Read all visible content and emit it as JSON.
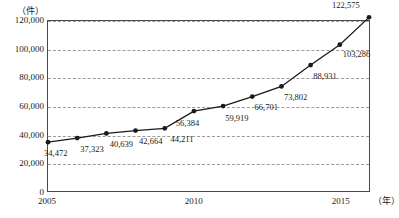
{
  "chart_data": {
    "type": "line",
    "title": "",
    "xlabel": "(年)",
    "ylabel": "(件)",
    "x": [
      2005,
      2006,
      2007,
      2008,
      2009,
      2010,
      2011,
      2012,
      2013,
      2014,
      2015,
      2016
    ],
    "values": [
      34472,
      37323,
      40639,
      42664,
      44211,
      56384,
      59919,
      66701,
      73802,
      88931,
      103286,
      122575
    ],
    "value_labels": [
      "34,472",
      "37,323",
      "40,639",
      "42,664",
      "44,211",
      "56,384",
      "59,919",
      "66,701",
      "73,802",
      "88,931",
      "103,286",
      "122,575"
    ],
    "ylim": [
      0,
      120000
    ],
    "yticks": [
      0,
      20000,
      40000,
      60000,
      80000,
      100000,
      120000
    ],
    "ytick_labels": [
      "0",
      "20,000",
      "40,000",
      "60,000",
      "80,000",
      "100,000",
      "120,000"
    ],
    "xlim": [
      2005,
      2016
    ],
    "xticks": [
      2005,
      2010,
      2015
    ],
    "xtick_labels": [
      "2005",
      "2010",
      "2015"
    ],
    "grid": true,
    "legend": "none",
    "series_color": "#1a1a1a",
    "grid_color": "#9a9a9a",
    "axis_color": "#4a4a4a",
    "marker": "filled-circle"
  },
  "axis": {
    "y_unit_label": "（件）",
    "x_unit_label": "（年）"
  }
}
